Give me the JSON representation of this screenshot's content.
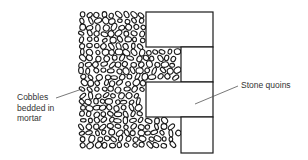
{
  "diagram": {
    "title": "",
    "elements": {
      "cobble_wall": {
        "description": "Wall infill of rounded cobbles bedded in mortar",
        "x": 78,
        "y": 12,
        "width": 104,
        "height": 141
      },
      "quoins": [
        {
          "name": "quoin-1",
          "type": "long",
          "x": 146,
          "y": 12,
          "width": 67,
          "height": 35
        },
        {
          "name": "quoin-2",
          "type": "short",
          "x": 181,
          "y": 47,
          "width": 32,
          "height": 35
        },
        {
          "name": "quoin-3",
          "type": "long",
          "x": 146,
          "y": 82,
          "width": 67,
          "height": 35
        },
        {
          "name": "quoin-4",
          "type": "short",
          "x": 181,
          "y": 117,
          "width": 32,
          "height": 36
        }
      ]
    },
    "labels": {
      "cobbles": "Cobbles\nbedded in\nmortar",
      "quoins": "Stone quoins"
    },
    "leaders": {
      "cobbles": {
        "x1": 56,
        "y1": 98,
        "x2": 82,
        "y2": 89
      },
      "quoins": {
        "x1": 238,
        "y1": 86,
        "x2": 195,
        "y2": 104
      }
    },
    "colors": {
      "line": "#1a1a1a",
      "label_text": "#333333",
      "leader": "#555555",
      "background": "#ffffff"
    }
  }
}
